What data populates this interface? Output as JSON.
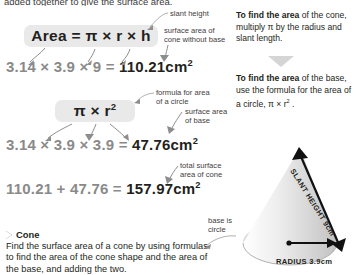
{
  "page": {
    "cut_top_text": "added together to give the surface area."
  },
  "formulas": {
    "cone_surface_label": "Area = π × r × h",
    "cone_surface_parts": {
      "word": "Area",
      "equals": "=",
      "pi": "π",
      "times1": "×",
      "r": "r",
      "times2": "×",
      "h": "h"
    },
    "circle_area_label": "π × r²",
    "circle_area_parts": {
      "pi": "π",
      "times": "×",
      "r": "r",
      "exp": "2"
    }
  },
  "equations": [
    {
      "id": "cone-lateral",
      "expression": "3.14 × 3.9 × 9 =",
      "a": "3.14",
      "b": "3.9",
      "c": "9",
      "result": "110.21cm",
      "result_exponent": "2",
      "note": "surface area of cone without base"
    },
    {
      "id": "base-area",
      "expression": "3.14 × 3.9 × 3.9 =",
      "a": "3.14",
      "b": "3.9",
      "c": "3.9",
      "result": "47.76cm",
      "result_exponent": "2",
      "note": "surface area of base"
    },
    {
      "id": "total-area",
      "expression": "110.21 + 47.76 =",
      "a": "110.21",
      "b": "47.76",
      "result": "157.97cm",
      "result_exponent": "2",
      "note": "total surface area of cone"
    }
  ],
  "annotations": {
    "slant_height": "slant height",
    "cone_without_base": "surface area of\ncone without base",
    "circle_formula": "formula for area\nof a circle",
    "surface_area_base": "surface area\nof base",
    "total_surface": "total surface\narea of cone",
    "base_is_circle": "base is\ncircle"
  },
  "right_column": [
    {
      "id": "find-area-cone",
      "bold": "To find the area",
      "rest": " of the cone, multiply π by the radius and slant length."
    },
    {
      "id": "find-area-base",
      "bold": "To find the area",
      "rest": " of the base, use the formula for the area of a circle, π × r",
      "exponent": "2",
      "tail": " ."
    }
  ],
  "cone_diagram": {
    "slant_height_label": "SLANT HEIGHT 9cm",
    "radius_label": "RADIUS 3.9cm",
    "body_color": "#d9d9d9",
    "base_color": "#c9c9c9"
  },
  "section": {
    "heading": "Cone",
    "body": "Find the surface area of a cone by using formulas to find the area of the cone shape and the area of the base, and adding the two."
  }
}
